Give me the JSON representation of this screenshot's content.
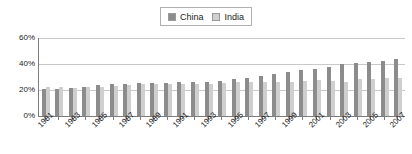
{
  "chart_data": {
    "type": "bar",
    "title": "",
    "xlabel": "",
    "ylabel": "",
    "ylim": [
      0,
      60
    ],
    "yticks": [
      0,
      20,
      40,
      60
    ],
    "ytick_labels": [
      "0%",
      "20%",
      "40%",
      "60%"
    ],
    "grid": true,
    "legend_position": "top-center",
    "categories": [
      "1981",
      "1982",
      "1983",
      "1984",
      "1985",
      "1986",
      "1987",
      "1988",
      "1989",
      "1990",
      "1991",
      "1992",
      "1993",
      "1994",
      "1995",
      "1996",
      "1997",
      "1998",
      "1999",
      "2000",
      "2001",
      "2002",
      "2003",
      "2004",
      "2005",
      "2006",
      "2007"
    ],
    "xtick_labels_shown": [
      "1981",
      "",
      "1983",
      "",
      "1985",
      "",
      "1987",
      "",
      "1989",
      "",
      "1991",
      "",
      "1993",
      "",
      "1995",
      "",
      "1997",
      "",
      "1999",
      "",
      "2001",
      "",
      "2003",
      "",
      "2005",
      "",
      "2007"
    ],
    "series": [
      {
        "name": "China",
        "color": "#8c8c8c",
        "values": [
          21,
          20.5,
          21.5,
          22.5,
          23.5,
          24.5,
          25,
          25.5,
          25.5,
          25.5,
          26,
          26,
          26.5,
          27,
          28.5,
          29.5,
          31,
          32.5,
          33.5,
          35.5,
          36.5,
          37.5,
          40,
          40.5,
          41.5,
          42.5,
          44
        ]
      },
      {
        "name": "India",
        "color": "#cfcfcf",
        "values": [
          22.5,
          22,
          21.5,
          22,
          22.5,
          23,
          24,
          24.5,
          25,
          25,
          25,
          25,
          25,
          25.5,
          26,
          26,
          26.5,
          26,
          26.5,
          27,
          27.5,
          27,
          26.5,
          28.5,
          28.5,
          29,
          29
        ]
      }
    ]
  },
  "legend": {
    "entries": [
      {
        "label": "China",
        "color": "#8c8c8c"
      },
      {
        "label": "India",
        "color": "#cfcfcf"
      }
    ]
  }
}
